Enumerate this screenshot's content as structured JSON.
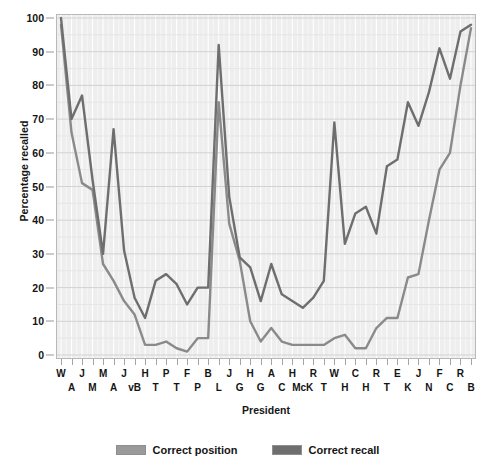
{
  "chart_data": {
    "type": "line",
    "title": "",
    "xlabel": "President",
    "ylabel": "Percentage recalled",
    "ylim": [
      0,
      100
    ],
    "ytick_step": 10,
    "yticks": [
      0,
      10,
      20,
      30,
      40,
      50,
      60,
      70,
      80,
      90,
      100
    ],
    "grid": true,
    "legend_position": "bottom",
    "categories": [
      "W A",
      "J A",
      "T J",
      "J M",
      "J M",
      "J Q A",
      "A J",
      "M vB",
      "W H H",
      "J T",
      "J P",
      "Z T",
      "M F",
      "F P",
      "J B",
      "A L",
      "A J",
      "U G",
      "R H",
      "J G",
      "C A",
      "G C",
      "B H",
      "W McK",
      "T R",
      "W T",
      "W W",
      "W H",
      "C C",
      "H H",
      "F R",
      "H T",
      "D E",
      "J K",
      "L J",
      "R N",
      "G F",
      "J C",
      "R R",
      "G B"
    ],
    "tick_labels": [
      {
        "row0": "W",
        "row1": "A"
      },
      {
        "row0": "J",
        "row1": "A"
      },
      {
        "row0": "",
        "row1": ""
      },
      {
        "row0": "J",
        "row1": "M"
      },
      {
        "row0": "M",
        "row1": "M"
      },
      {
        "row0": "M",
        "row1": "A"
      },
      {
        "row0": "",
        "row1": ""
      },
      {
        "row0": "J",
        "row1": "vB"
      },
      {
        "row0": "H",
        "row1": "T"
      },
      {
        "row0": "",
        "row1": ""
      },
      {
        "row0": "P",
        "row1": "T"
      },
      {
        "row0": "",
        "row1": ""
      },
      {
        "row0": "F",
        "row1": "P"
      },
      {
        "row0": "",
        "row1": ""
      },
      {
        "row0": "B",
        "row1": "L"
      },
      {
        "row0": "",
        "row1": ""
      },
      {
        "row0": "J",
        "row1": "G"
      },
      {
        "row0": "",
        "row1": ""
      },
      {
        "row0": "H",
        "row1": "G"
      },
      {
        "row0": "",
        "row1": ""
      },
      {
        "row0": "A",
        "row1": "C"
      },
      {
        "row0": "",
        "row1": ""
      },
      {
        "row0": "H",
        "row1": "McK"
      },
      {
        "row0": "",
        "row1": ""
      },
      {
        "row0": "R",
        "row1": "T"
      },
      {
        "row0": "",
        "row1": ""
      },
      {
        "row0": "W",
        "row1": "H"
      },
      {
        "row0": "",
        "row1": ""
      },
      {
        "row0": "C",
        "row1": "H"
      },
      {
        "row0": "",
        "row1": ""
      },
      {
        "row0": "R",
        "row1": "T"
      },
      {
        "row0": "",
        "row1": ""
      },
      {
        "row0": "E",
        "row1": "K"
      },
      {
        "row0": "",
        "row1": ""
      },
      {
        "row0": "J",
        "row1": "N"
      },
      {
        "row0": "",
        "row1": ""
      },
      {
        "row0": "F",
        "row1": "C"
      },
      {
        "row0": "",
        "row1": ""
      },
      {
        "row0": "R",
        "row1": "B"
      },
      {
        "row0": "",
        "row1": ""
      }
    ],
    "xtick_row_labels": [
      "W",
      "A",
      "J",
      "M",
      "M",
      "A",
      "J",
      "vB",
      "H",
      "T",
      "P",
      "T",
      "F",
      "P",
      "B",
      "L",
      "J",
      "G",
      "H",
      "G",
      "A",
      "C",
      "H",
      "McK",
      "R",
      "T",
      "W",
      "H",
      "C",
      "H",
      "R",
      "T",
      "E",
      "K",
      "J",
      "N",
      "F",
      "C",
      "R",
      "B"
    ],
    "series": [
      {
        "name": "Correct recall",
        "color": "#6e6e6e",
        "values": [
          100,
          70,
          77,
          52,
          30,
          67,
          31,
          17,
          11,
          22,
          24,
          21,
          15,
          20,
          20,
          92,
          47,
          29,
          26,
          16,
          27,
          18,
          16,
          14,
          17,
          22,
          69,
          33,
          42,
          44,
          36,
          56,
          58,
          75,
          68,
          78,
          91,
          82,
          96,
          98
        ]
      },
      {
        "name": "Correct position",
        "color": "#8a8a8a",
        "values": [
          98,
          66,
          51,
          49,
          27,
          22,
          16,
          12,
          3,
          3,
          4,
          2,
          1,
          5,
          5,
          75,
          39,
          28,
          10,
          4,
          8,
          4,
          3,
          3,
          3,
          3,
          5,
          6,
          2,
          2,
          8,
          11,
          11,
          23,
          24,
          40,
          55,
          60,
          80,
          97
        ]
      }
    ]
  },
  "legend": {
    "items": [
      {
        "label": "Correct position",
        "color": "#9a9a9a"
      },
      {
        "label": "Correct recall",
        "color": "#6e6e6e"
      }
    ]
  },
  "axes": {
    "y_title": "Percentage recalled",
    "x_title": "President"
  }
}
